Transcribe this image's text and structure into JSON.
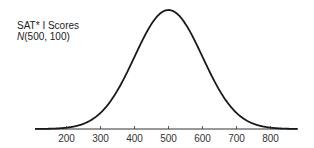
{
  "chart_data": {
    "type": "line",
    "title": "SAT* I Scores",
    "subtitle": "N(500, 100)",
    "subtitle_italic_prefix": "N",
    "subtitle_rest": "(500, 100)",
    "xlabel": "",
    "ylabel": "",
    "distribution": {
      "kind": "normal",
      "mean": 500,
      "sd": 100
    },
    "xlim": [
      100,
      890
    ],
    "x_ticks": [
      200,
      300,
      400,
      500,
      600,
      700,
      800
    ],
    "x_tick_labels": [
      "200",
      "300",
      "400",
      "500",
      "600",
      "700",
      "800"
    ],
    "grid": false,
    "legend": null,
    "colors": {
      "curve": "#1a1a1a",
      "axis": "#333333",
      "text": "#333333"
    }
  }
}
